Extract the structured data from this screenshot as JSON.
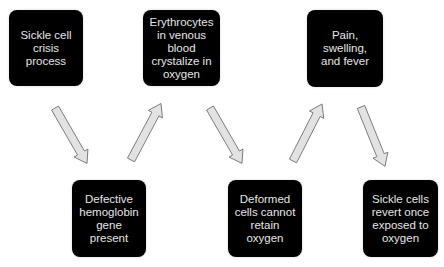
{
  "diagram": {
    "type": "flow",
    "colors": {
      "box_fill": "#000000",
      "box_text": "#e6e6e6",
      "arrow_fill": "#e2e2e2",
      "arrow_stroke": "#6e6e6e",
      "background": "#ffffff"
    },
    "nodes": [
      {
        "id": "n1",
        "label": "Sickle cell\ncrisis\nprocess",
        "row": "top"
      },
      {
        "id": "n2",
        "label": "Defective\nhemoglobin\ngene present",
        "row": "bottom"
      },
      {
        "id": "n3",
        "label": "Erythrocytes\nin venous\nblood\ncrystalize in\noxygen",
        "row": "top"
      },
      {
        "id": "n4",
        "label": "Deformed\ncells cannot\nretain\noxygen",
        "row": "bottom"
      },
      {
        "id": "n5",
        "label": "Pain,\nswelling,\nand fever",
        "row": "top"
      },
      {
        "id": "n6",
        "label": "Sickle cells\nrevert once\nexposed to\noxygen",
        "row": "bottom"
      }
    ],
    "edges": [
      {
        "from": "n1",
        "to": "n2",
        "icon": "arrow-down-right"
      },
      {
        "from": "n2",
        "to": "n3",
        "icon": "arrow-up-right"
      },
      {
        "from": "n3",
        "to": "n4",
        "icon": "arrow-down-right"
      },
      {
        "from": "n4",
        "to": "n5",
        "icon": "arrow-up-right"
      },
      {
        "from": "n5",
        "to": "n6",
        "icon": "arrow-down-right"
      }
    ]
  }
}
